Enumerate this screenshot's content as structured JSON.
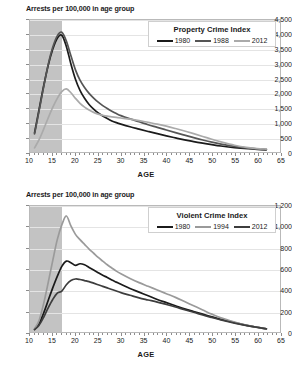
{
  "charts": [
    {
      "id": "property",
      "ylabel": "Arrests per 100,000 in age group",
      "xlabel": "AGE",
      "legend_title": "Property Crime Index",
      "yticks": [
        "0",
        "500",
        "1,000",
        "1,500",
        "2,000",
        "2,500",
        "3,000",
        "3,500",
        "4,000",
        "4,500"
      ],
      "xticks": [
        "10",
        "15",
        "20",
        "25",
        "30",
        "35",
        "40",
        "45",
        "50",
        "55",
        "60",
        "65"
      ],
      "series_names": [
        "1980",
        "1988",
        "2012"
      ],
      "colors": [
        "#1b1b1b",
        "#555555",
        "#aaaaaa"
      ]
    },
    {
      "id": "violent",
      "ylabel": "Arrests per 100,000 in age group",
      "xlabel": "AGE",
      "legend_title": "Violent Crime Index",
      "yticks": [
        "0",
        "200",
        "400",
        "600",
        "800",
        "1,000",
        "1,200"
      ],
      "xticks": [
        "10",
        "15",
        "20",
        "25",
        "30",
        "35",
        "40",
        "45",
        "50",
        "55",
        "60",
        "65"
      ],
      "series_names": [
        "1980",
        "1994",
        "2012"
      ],
      "colors": [
        "#1b1b1b",
        "#9a9a9a",
        "#3d3d3d"
      ]
    }
  ],
  "chart_data": [
    {
      "type": "line",
      "title": "Property Crime Index",
      "xlabel": "AGE",
      "ylabel": "Arrests per 100,000 in age group",
      "xlim": [
        10,
        65
      ],
      "ylim": [
        0,
        4500
      ],
      "ytick_step": 500,
      "xtick_step": 5,
      "grid": true,
      "legend_position": "top-right",
      "shaded_region": {
        "x_from": 10,
        "x_to": 17,
        "color": "#b9b9b9",
        "note": "juvenile ages"
      },
      "x": [
        11,
        12,
        13,
        14,
        15,
        16,
        17,
        18,
        19,
        20,
        21,
        22,
        23,
        24,
        25,
        26,
        27,
        28,
        29,
        30,
        32,
        34,
        36,
        38,
        40,
        42,
        44,
        46,
        48,
        50,
        52,
        55,
        58,
        60,
        62
      ],
      "series": [
        {
          "name": "1980",
          "color": "#1b1b1b",
          "values": [
            650,
            1450,
            2250,
            2950,
            3500,
            3880,
            3980,
            3600,
            3000,
            2480,
            2100,
            1830,
            1620,
            1460,
            1330,
            1230,
            1140,
            1060,
            1000,
            950,
            860,
            780,
            700,
            625,
            550,
            480,
            415,
            355,
            300,
            250,
            205,
            150,
            110,
            90,
            75
          ]
        },
        {
          "name": "1988",
          "color": "#555555",
          "values": [
            620,
            1400,
            2220,
            2980,
            3570,
            3960,
            4080,
            3780,
            3280,
            2800,
            2450,
            2200,
            2000,
            1840,
            1700,
            1580,
            1480,
            1390,
            1310,
            1240,
            1130,
            1030,
            930,
            840,
            750,
            660,
            575,
            490,
            410,
            335,
            270,
            190,
            130,
            105,
            90
          ]
        },
        {
          "name": "2012",
          "color": "#aaaaaa",
          "values": [
            140,
            420,
            780,
            1160,
            1520,
            1830,
            2060,
            2150,
            2020,
            1830,
            1660,
            1530,
            1430,
            1350,
            1290,
            1250,
            1220,
            1200,
            1180,
            1160,
            1120,
            1070,
            1010,
            950,
            880,
            800,
            715,
            625,
            530,
            435,
            345,
            230,
            150,
            115,
            100
          ]
        }
      ]
    },
    {
      "type": "line",
      "title": "Violent Crime Index",
      "xlabel": "AGE",
      "ylabel": "Arrests per 100,000 in age group",
      "xlim": [
        10,
        65
      ],
      "ylim": [
        0,
        1200
      ],
      "ytick_step": 200,
      "xtick_step": 5,
      "grid": true,
      "legend_position": "top-right",
      "shaded_region": {
        "x_from": 10,
        "x_to": 17,
        "color": "#b9b9b9",
        "note": "juvenile ages"
      },
      "x": [
        11,
        12,
        13,
        14,
        15,
        16,
        17,
        18,
        19,
        20,
        21,
        22,
        23,
        24,
        25,
        26,
        27,
        28,
        29,
        30,
        32,
        34,
        36,
        38,
        40,
        42,
        44,
        46,
        48,
        50,
        52,
        55,
        58,
        60,
        62
      ],
      "series": [
        {
          "name": "1980",
          "color": "#1b1b1b",
          "values": [
            25,
            80,
            180,
            300,
            420,
            530,
            625,
            675,
            660,
            635,
            650,
            640,
            615,
            590,
            565,
            540,
            520,
            495,
            475,
            455,
            415,
            380,
            345,
            310,
            280,
            250,
            220,
            195,
            170,
            145,
            120,
            90,
            60,
            45,
            30
          ]
        },
        {
          "name": "1994",
          "color": "#9a9a9a",
          "values": [
            30,
            110,
            270,
            470,
            680,
            880,
            1020,
            1105,
            1010,
            930,
            880,
            835,
            790,
            750,
            710,
            675,
            640,
            610,
            580,
            555,
            510,
            470,
            435,
            400,
            365,
            330,
            290,
            250,
            210,
            170,
            135,
            95,
            60,
            45,
            30
          ]
        },
        {
          "name": "2012",
          "color": "#3d3d3d",
          "values": [
            22,
            65,
            140,
            230,
            310,
            370,
            390,
            450,
            490,
            505,
            500,
            490,
            480,
            465,
            450,
            435,
            420,
            405,
            390,
            375,
            350,
            325,
            305,
            285,
            262,
            238,
            212,
            188,
            162,
            138,
            115,
            85,
            58,
            44,
            30
          ]
        }
      ]
    }
  ]
}
